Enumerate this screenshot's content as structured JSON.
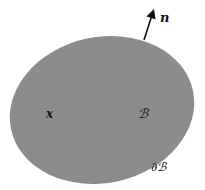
{
  "diagram": {
    "body": {
      "label": "ℬ",
      "fill": "#8c8c8c",
      "shape": "ellipse"
    },
    "point": {
      "label": "x"
    },
    "boundary": {
      "label": "∂ℬ"
    },
    "normal": {
      "label": "n",
      "color": "#111111"
    }
  }
}
